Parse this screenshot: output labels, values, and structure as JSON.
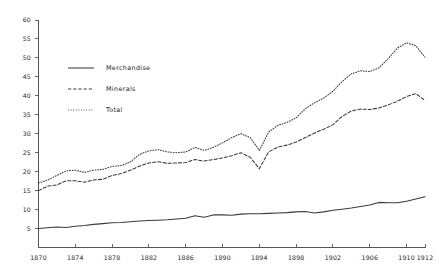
{
  "chart_data": {
    "type": "line",
    "title": "",
    "subtitle": "",
    "xlabel": "",
    "ylabel": "",
    "xlim": [
      1870,
      1912
    ],
    "ylim": [
      0,
      60
    ],
    "grid": false,
    "legend_position": "upper-left-inside",
    "x_tick_labels": [
      "1870",
      "1874",
      "1878",
      "1882",
      "1886",
      "1890",
      "1894",
      "1898",
      "1902",
      "1906",
      "1910",
      "1912"
    ],
    "x_tick_values": [
      1870,
      1874,
      1878,
      1882,
      1886,
      1890,
      1894,
      1898,
      1902,
      1906,
      1910,
      1912
    ],
    "y_tick_labels": [
      "5",
      "10",
      "15",
      "20",
      "25",
      "30",
      "35",
      "40",
      "45",
      "50",
      "55",
      "60"
    ],
    "y_tick_values": [
      5,
      10,
      15,
      20,
      25,
      30,
      35,
      40,
      45,
      50,
      55,
      60
    ],
    "x": [
      1870,
      1871,
      1872,
      1873,
      1874,
      1875,
      1876,
      1877,
      1878,
      1879,
      1880,
      1881,
      1882,
      1883,
      1884,
      1885,
      1886,
      1887,
      1888,
      1889,
      1890,
      1891,
      1892,
      1893,
      1894,
      1895,
      1896,
      1897,
      1898,
      1899,
      1900,
      1901,
      1902,
      1903,
      1904,
      1905,
      1906,
      1907,
      1908,
      1909,
      1910,
      1911,
      1912
    ],
    "series": [
      {
        "name": "Merchandise",
        "style": "solid",
        "values": [
          5.0,
          5.2,
          5.4,
          5.3,
          5.6,
          5.8,
          6.1,
          6.3,
          6.5,
          6.6,
          6.8,
          7.0,
          7.1,
          7.2,
          7.3,
          7.5,
          7.7,
          8.4,
          8.0,
          8.6,
          8.6,
          8.5,
          8.8,
          8.9,
          8.9,
          9.0,
          9.1,
          9.2,
          9.4,
          9.5,
          9.1,
          9.4,
          9.8,
          10.1,
          10.4,
          10.8,
          11.2,
          11.9,
          11.8,
          11.8,
          12.2,
          12.8,
          13.4
        ]
      },
      {
        "name": "Minerals",
        "style": "dashed",
        "values": [
          15.0,
          16.2,
          16.5,
          17.6,
          17.6,
          17.2,
          17.8,
          18.0,
          19.0,
          19.5,
          20.4,
          21.5,
          22.3,
          22.6,
          22.2,
          22.3,
          22.4,
          23.2,
          22.8,
          23.2,
          23.6,
          24.2,
          25.0,
          23.8,
          20.8,
          25.2,
          26.5,
          27.0,
          27.8,
          29.0,
          30.2,
          31.2,
          32.4,
          34.6,
          36.0,
          36.5,
          36.4,
          36.8,
          37.6,
          38.6,
          39.8,
          40.6,
          38.8
        ]
      },
      {
        "name": "Total",
        "style": "dotted",
        "values": [
          17.0,
          17.8,
          19.0,
          20.2,
          20.4,
          19.8,
          20.4,
          20.6,
          21.4,
          21.6,
          22.6,
          24.6,
          25.5,
          25.8,
          25.2,
          25.0,
          25.2,
          26.4,
          25.6,
          26.4,
          27.6,
          29.0,
          30.0,
          29.0,
          25.6,
          30.4,
          32.2,
          33.0,
          34.2,
          36.6,
          38.2,
          39.4,
          41.2,
          43.8,
          45.8,
          46.6,
          46.4,
          47.4,
          49.8,
          52.6,
          54.0,
          53.2,
          50.2
        ]
      }
    ],
    "legend": [
      {
        "label": "Merchandise",
        "style": "solid"
      },
      {
        "label": "Minerals",
        "style": "dashed"
      },
      {
        "label": "Total",
        "style": "dotted"
      }
    ]
  }
}
